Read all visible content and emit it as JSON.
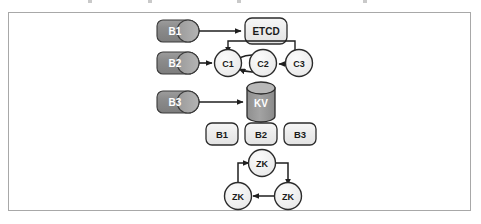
{
  "figure": {
    "type": "architecture-diagram",
    "background_color": "#ffffff",
    "panel_border_color": "#a8a8a8"
  },
  "colors": {
    "cylinder_dark_fill": "#8a8a8a",
    "cylinder_dark_edge": "#a6a6a6",
    "cylinder_kv_fill": "#9b9b9b",
    "cylinder_kv_top": "#b5b5b5",
    "box_light_fill": "#ebebeb",
    "circle_fill": "#efefef",
    "stroke": "#2b2b2b",
    "arrow": "#1f1f1f"
  },
  "rows": {
    "row1": {
      "name": "etcd-row",
      "source": {
        "id": "b1-cylinder-top",
        "label": "B1",
        "shape": "cylinder-horizontal",
        "style": "dark"
      },
      "target": {
        "id": "etcd-box",
        "label": "ETCD",
        "shape": "rounded-rect",
        "style": "light"
      },
      "edges": [
        {
          "from": "B1",
          "to": "ETCD",
          "direction": "right"
        }
      ]
    },
    "row2": {
      "name": "consul-row",
      "source": {
        "id": "b2-cylinder",
        "label": "B2",
        "shape": "cylinder-horizontal",
        "style": "dark"
      },
      "nodes": [
        {
          "id": "c1-circle",
          "label": "C1",
          "shape": "circle",
          "style": "light"
        },
        {
          "id": "c2-circle",
          "label": "C2",
          "shape": "circle",
          "style": "light"
        },
        {
          "id": "c3-circle",
          "label": "C3",
          "shape": "circle",
          "style": "light"
        }
      ],
      "edges": [
        {
          "from": "B2",
          "to": "C1",
          "direction": "right"
        },
        {
          "from": "C1",
          "to": "C2",
          "direction": "right",
          "style": "curved-top"
        },
        {
          "from": "C2",
          "to": "C1",
          "direction": "left",
          "style": "curved-bottom"
        },
        {
          "from": "C3",
          "to": "C2",
          "direction": "left"
        },
        {
          "from": "C3",
          "to": "C1",
          "direction": "routed-top"
        }
      ]
    },
    "row3": {
      "name": "kv-row",
      "source": {
        "id": "b3-cylinder",
        "label": "B3",
        "shape": "cylinder-horizontal",
        "style": "dark"
      },
      "target": {
        "id": "kv-cylinder",
        "label": "KV",
        "shape": "cylinder-vertical",
        "style": "dark"
      },
      "edges": [
        {
          "from": "B3",
          "to": "KV",
          "direction": "right"
        }
      ]
    },
    "row4": {
      "name": "broker-box-row",
      "boxes": [
        {
          "id": "b1-box",
          "label": "B1",
          "shape": "rounded-rect",
          "style": "light"
        },
        {
          "id": "b2-box",
          "label": "B2",
          "shape": "rounded-rect",
          "style": "light"
        },
        {
          "id": "b3-box",
          "label": "B3",
          "shape": "rounded-rect",
          "style": "light"
        }
      ]
    },
    "row5": {
      "name": "zookeeper-ensemble",
      "nodes": [
        {
          "id": "zk-top",
          "label": "ZK",
          "shape": "circle",
          "style": "light"
        },
        {
          "id": "zk-bottom-left",
          "label": "ZK",
          "shape": "circle",
          "style": "light"
        },
        {
          "id": "zk-bottom-right",
          "label": "ZK",
          "shape": "circle",
          "style": "light"
        }
      ],
      "edges": [
        {
          "from": "zk-bottom-left",
          "to": "zk-top",
          "direction": "up-right"
        },
        {
          "from": "zk-top",
          "to": "zk-bottom-right",
          "direction": "right-down"
        },
        {
          "from": "zk-bottom-right",
          "to": "zk-bottom-left",
          "direction": "left"
        }
      ]
    }
  }
}
